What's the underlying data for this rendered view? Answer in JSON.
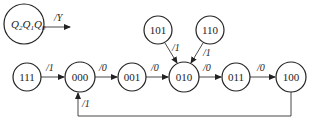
{
  "legend": {
    "state_label": "Q2Q1Q0",
    "q": "Q",
    "subs": [
      "2",
      "1",
      "0"
    ],
    "output_label": "/Y"
  },
  "states": [
    {
      "id": "111",
      "label": "111"
    },
    {
      "id": "000",
      "label": "000"
    },
    {
      "id": "001",
      "label": "001"
    },
    {
      "id": "010",
      "label": "010"
    },
    {
      "id": "011",
      "label": "011"
    },
    {
      "id": "100",
      "label": "100"
    },
    {
      "id": "101",
      "label": "101"
    },
    {
      "id": "110",
      "label": "110"
    }
  ],
  "transitions": [
    {
      "from": "111",
      "to": "000",
      "label": "/1"
    },
    {
      "from": "000",
      "to": "001",
      "label": "/0"
    },
    {
      "from": "001",
      "to": "010",
      "label": "/0"
    },
    {
      "from": "101",
      "to": "010",
      "label": "/1"
    },
    {
      "from": "110",
      "to": "010",
      "label": "/1"
    },
    {
      "from": "010",
      "to": "011",
      "label": "/0"
    },
    {
      "from": "011",
      "to": "100",
      "label": "/0"
    },
    {
      "from": "100",
      "to": "000",
      "label": "/1"
    }
  ]
}
